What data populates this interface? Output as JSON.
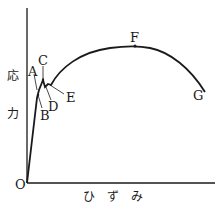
{
  "diagram": {
    "type": "stress-strain-curve",
    "y_axis_label_top": "応",
    "y_axis_label_bottom": "力",
    "x_axis_label": "ひ ず み",
    "origin_label": "O",
    "points": {
      "A": "A",
      "B": "B",
      "C": "C",
      "D": "D",
      "E": "E",
      "F": "F",
      "G": "G"
    }
  }
}
